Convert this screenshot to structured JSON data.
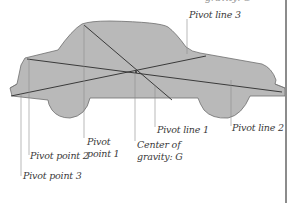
{
  "diagram": {
    "colors": {
      "body_fill": "#b9b9b9",
      "body_stroke": "#6e6e6e",
      "line": "#2b2b2b",
      "leader": "#8a8a8a",
      "text": "#3a3a3a",
      "frame": "#8c8c8c"
    },
    "labels": {
      "pivot_line_3": "Pivot line 3",
      "pivot_line_1": "Pivot line 1",
      "pivot_line_2": "Pivot line 2",
      "pivot_point_1_line1": "Pivot",
      "pivot_point_1_line2": "point 1",
      "pivot_point_2": "Pivot point 2",
      "pivot_point_3": "Pivot point 3",
      "center_of_gravity_line1": "Center of",
      "center_of_gravity_line2": "gravity: G",
      "top_cropped": "gravity: G"
    }
  }
}
